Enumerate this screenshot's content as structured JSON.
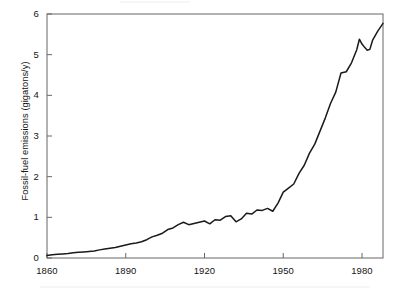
{
  "figure": {
    "background_color": "#ffffff",
    "line_color": "#1a1a1a",
    "axis_color": "#555555",
    "text_color": "#141414"
  },
  "axes": {
    "y_label": "Fossil-fuel emissions (gigatons/y)",
    "x_label": "",
    "y_ticks": [
      "0",
      "1",
      "2",
      "3",
      "4",
      "5",
      "6"
    ],
    "x_ticks": [
      "1860",
      "1890",
      "1920",
      "1950",
      "1980"
    ]
  },
  "chart_data": {
    "type": "line",
    "title": "",
    "xlabel": "",
    "ylabel": "Fossil-fuel emissions (gigatons/y)",
    "xlim": [
      1860,
      1988
    ],
    "ylim": [
      0,
      6
    ],
    "xticks": [
      1860,
      1890,
      1920,
      1950,
      1980
    ],
    "yticks": [
      0,
      1,
      2,
      3,
      4,
      5,
      6
    ],
    "grid": false,
    "legend": null,
    "series": [
      {
        "name": "Global fossil-fuel emissions",
        "x": [
          1860,
          1862,
          1864,
          1866,
          1868,
          1870,
          1872,
          1874,
          1876,
          1878,
          1880,
          1882,
          1884,
          1886,
          1888,
          1890,
          1892,
          1894,
          1896,
          1898,
          1900,
          1902,
          1904,
          1906,
          1908,
          1910,
          1912,
          1914,
          1916,
          1918,
          1920,
          1922,
          1924,
          1926,
          1928,
          1930,
          1932,
          1934,
          1936,
          1938,
          1940,
          1942,
          1944,
          1946,
          1948,
          1950,
          1952,
          1954,
          1956,
          1958,
          1960,
          1962,
          1964,
          1966,
          1968,
          1970,
          1972,
          1974,
          1976,
          1978,
          1979,
          1980,
          1981,
          1982,
          1983,
          1984,
          1986,
          1988
        ],
        "y": [
          0.06,
          0.08,
          0.09,
          0.1,
          0.11,
          0.13,
          0.14,
          0.15,
          0.16,
          0.17,
          0.2,
          0.22,
          0.24,
          0.26,
          0.29,
          0.32,
          0.35,
          0.37,
          0.4,
          0.45,
          0.52,
          0.56,
          0.61,
          0.7,
          0.74,
          0.82,
          0.88,
          0.82,
          0.85,
          0.88,
          0.91,
          0.84,
          0.94,
          0.93,
          1.02,
          1.04,
          0.89,
          0.96,
          1.1,
          1.08,
          1.18,
          1.17,
          1.22,
          1.15,
          1.35,
          1.62,
          1.72,
          1.82,
          2.08,
          2.28,
          2.58,
          2.8,
          3.12,
          3.44,
          3.8,
          4.08,
          4.55,
          4.58,
          4.8,
          5.12,
          5.38,
          5.26,
          5.18,
          5.11,
          5.13,
          5.35,
          5.58,
          5.77
        ]
      }
    ]
  }
}
